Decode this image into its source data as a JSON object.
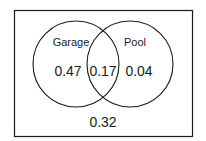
{
  "diagram": {
    "type": "venn",
    "sets": [
      {
        "label": "Garage",
        "only_value": "0.47"
      },
      {
        "label": "Pool",
        "only_value": "0.04"
      }
    ],
    "intersection_value": "0.17",
    "outside_value": "0.32",
    "colors": {
      "stroke": "#1a1a1a",
      "background": "#ffffff"
    }
  }
}
